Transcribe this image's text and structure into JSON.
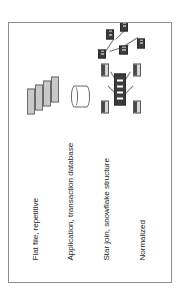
{
  "figure": {
    "background_color": "#ffffff",
    "frame_border_color": "#8e8e8e",
    "orientation": "rotated-90",
    "rows": [
      {
        "id": "flat-file",
        "label": "Flat file, repetitive",
        "shape": "stacked-rectangles",
        "shape_count": 4,
        "fill_color": "#c9c9c9"
      },
      {
        "id": "application",
        "label": "Application, transaction database",
        "shape": "cylinder",
        "shape_count": 1,
        "fill_color": "#ffffff"
      },
      {
        "id": "star-join",
        "label": "Star join, snowflake structure",
        "shape": "star-schema",
        "shape_count": 5,
        "fill_color": "#3c3c3c"
      },
      {
        "id": "normalized",
        "label": "Normalized",
        "shape": "normalized-tables",
        "shape_count": 6,
        "fill_color": "#3c3c3c"
      }
    ]
  },
  "labels": {
    "flat_file": "Flat file, repetitive",
    "application": "Application, transaction database",
    "star_join": "Star join, snowflake structure",
    "normalized": "Normalized"
  }
}
